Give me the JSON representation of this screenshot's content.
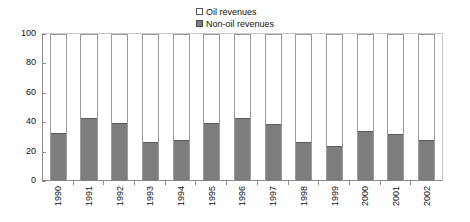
{
  "chart_data": {
    "type": "bar",
    "subtype": "stacked-100-percent",
    "title": "",
    "xlabel": "",
    "ylabel": "",
    "ylim": [
      0,
      100
    ],
    "yticks": [
      0,
      20,
      40,
      60,
      80,
      100
    ],
    "ytick_labels": [
      "0",
      "20",
      "40",
      "60",
      "80",
      "100"
    ],
    "grid": false,
    "legend_position": "top-center",
    "categories": [
      "1990",
      "1991",
      "1992",
      "1993",
      "1994",
      "1995",
      "1996",
      "1997",
      "1998",
      "1999",
      "2000",
      "2001",
      "2002"
    ],
    "series": [
      {
        "name": "Oil revenues",
        "color": "#ffffff",
        "values": [
          67,
          57,
          60,
          73,
          72,
          60,
          57,
          61,
          73,
          76,
          66,
          68,
          72
        ]
      },
      {
        "name": "Non-oil revenues",
        "color": "#7d7d7d",
        "values": [
          33,
          43,
          40,
          27,
          28,
          40,
          43,
          39,
          27,
          24,
          34,
          32,
          28
        ]
      }
    ]
  },
  "legend": {
    "items": [
      {
        "label": "Oil revenues",
        "swatch": "oil"
      },
      {
        "label": "Non-oil revenues",
        "swatch": "nonoil"
      }
    ]
  },
  "colors": {
    "non_oil_fill": "#7d7d7d",
    "oil_fill": "#ffffff",
    "axis": "#8a8a8a",
    "bar_outline": "#9a9a9a",
    "text": "#111111"
  }
}
